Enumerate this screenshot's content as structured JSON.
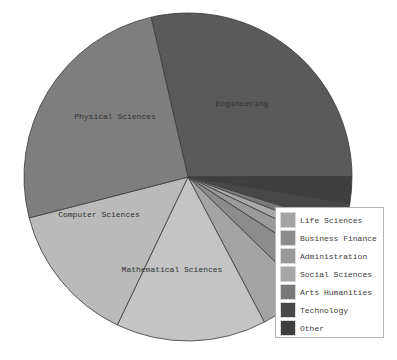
{
  "chart_data": {
    "type": "pie",
    "title": "",
    "start_angle_deg": -103,
    "direction": "clockwise",
    "slices": [
      {
        "label": "Engineering",
        "value": 28.6,
        "color": "#5a5a5a",
        "show_label": true
      },
      {
        "label": "Other",
        "value": 2.6,
        "color": "#3f3f3f",
        "show_label": false
      },
      {
        "label": "Technology",
        "value": 2.2,
        "color": "#484848",
        "show_label": false
      },
      {
        "label": "Arts Humanities",
        "value": 1.0,
        "color": "#7a7a7a",
        "show_label": false
      },
      {
        "label": "Social Sciences",
        "value": 1.3,
        "color": "#a8a8a8",
        "show_label": false
      },
      {
        "label": "Administration",
        "value": 2.0,
        "color": "#9a9a9a",
        "show_label": false
      },
      {
        "label": "Business Finance",
        "value": 3.2,
        "color": "#8c8c8c",
        "show_label": false
      },
      {
        "label": "Life Sciences",
        "value": 5.0,
        "color": "#a4a4a4",
        "show_label": false
      },
      {
        "label": "Mathematical Sciences",
        "value": 14.8,
        "color": "#c4c4c4",
        "show_label": true
      },
      {
        "label": "Computer Sciences",
        "value": 13.9,
        "color": "#bababa",
        "show_label": true
      },
      {
        "label": "Physical Sciences",
        "value": 25.4,
        "color": "#7e7e7e",
        "show_label": true
      }
    ],
    "legend": {
      "position": "lower right",
      "entries": [
        {
          "label": "Life Sciences",
          "color": "#a4a4a4"
        },
        {
          "label": "Business Finance",
          "color": "#8c8c8c"
        },
        {
          "label": "Administration",
          "color": "#9a9a9a"
        },
        {
          "label": "Social Sciences",
          "color": "#a8a8a8"
        },
        {
          "label": "Arts Humanities",
          "color": "#7a7a7a"
        },
        {
          "label": "Technology",
          "color": "#484848"
        },
        {
          "label": "Other",
          "color": "#3f3f3f"
        }
      ]
    }
  },
  "labels": {
    "engineering": "Engineering",
    "physical_sciences": "Physical Sciences",
    "computer_sciences": "Computer Sciences",
    "mathematical_sciences": "Mathematical Sciences"
  },
  "legend": {
    "items": [
      {
        "label": "Life Sciences",
        "color": "#a4a4a4"
      },
      {
        "label": "Business Finance",
        "color": "#8c8c8c"
      },
      {
        "label": "Administration",
        "color": "#9a9a9a"
      },
      {
        "label": "Social Sciences",
        "color": "#a8a8a8"
      },
      {
        "label": "Arts Humanities",
        "color": "#7a7a7a"
      },
      {
        "label": "Technology",
        "color": "#484848"
      },
      {
        "label": "Other",
        "color": "#3f3f3f"
      }
    ]
  }
}
